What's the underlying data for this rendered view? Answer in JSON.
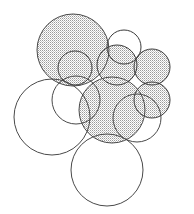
{
  "figure": {
    "canvas": {
      "width": 194,
      "height": 214
    },
    "style": {
      "background_color": "#ffffff",
      "outline_color": "#3a3a3a",
      "outline_color_light": "#6d6d6d",
      "hatch_color": "#8a8a8a",
      "hatch_fill_base": "#ffffff",
      "stroke_width": 1.0
    },
    "circles": [
      {
        "id": "c1",
        "name": "large-shaded-circle-upper-left",
        "cx": 73,
        "cy": 50,
        "r": 36,
        "shaded": true,
        "stroke": "#4a4a4a"
      },
      {
        "id": "c2",
        "name": "small-shaded-circle-upper-center",
        "cx": 75,
        "cy": 68,
        "r": 17,
        "shaded": true,
        "stroke": "#3a3a3a"
      },
      {
        "id": "c3",
        "name": "white-circle-top-right",
        "cx": 124,
        "cy": 47,
        "r": 17,
        "shaded": false,
        "stroke": "#3a3a3a"
      },
      {
        "id": "c4",
        "name": "shaded-circle-right-upper",
        "cx": 117,
        "cy": 65,
        "r": 20,
        "shaded": true,
        "stroke": "#3a3a3a"
      },
      {
        "id": "c5",
        "name": "shaded-circle-right-outer",
        "cx": 152,
        "cy": 67,
        "r": 18,
        "shaded": true,
        "stroke": "#3a3a3a"
      },
      {
        "id": "c6",
        "name": "shaded-circle-right-lower",
        "cx": 152,
        "cy": 100,
        "r": 18,
        "shaded": true,
        "stroke": "#3a3a3a"
      },
      {
        "id": "c7",
        "name": "shaded-circle-center-lower",
        "cx": 112,
        "cy": 110,
        "r": 33,
        "shaded": true,
        "stroke": "#4a4a4a"
      },
      {
        "id": "c8",
        "name": "large-white-circle-lower-left",
        "cx": 52,
        "cy": 117,
        "r": 38,
        "shaded": false,
        "stroke": "#4a4a4a"
      },
      {
        "id": "c9",
        "name": "white-circle-mid-left",
        "cx": 76,
        "cy": 100,
        "r": 24,
        "shaded": false,
        "stroke": "#4a4a4a"
      },
      {
        "id": "c10",
        "name": "large-white-circle-bottom",
        "cx": 107,
        "cy": 170,
        "r": 36,
        "shaded": false,
        "stroke": "#4a4a4a"
      },
      {
        "id": "c11",
        "name": "white-circle-bottom-right-arc",
        "cx": 137,
        "cy": 118,
        "r": 24,
        "shaded": false,
        "stroke": "#4a4a4a"
      }
    ],
    "shaded_group": [
      "c1",
      "c2",
      "c4",
      "c5",
      "c6",
      "c7"
    ],
    "unshaded_group": [
      "c3",
      "c8",
      "c9",
      "c10",
      "c11"
    ]
  }
}
